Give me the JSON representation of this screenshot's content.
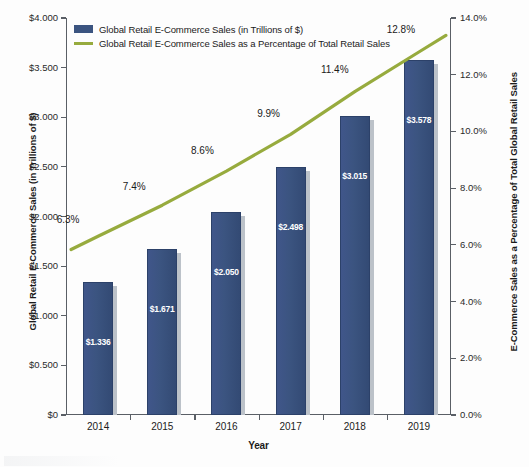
{
  "chart_data": {
    "type": "bar",
    "title": "",
    "subtitle": "",
    "xlabel": "Year",
    "ylabel": "Global Retail E-Commerce Sales (in Trillions of $)",
    "y2label": "E-Commerce Sales as a Percentage of Total Global Retail Sales",
    "categories": [
      "2014",
      "2015",
      "2016",
      "2017",
      "2018",
      "2019"
    ],
    "ylim": [
      0,
      4.0
    ],
    "y2lim": [
      0,
      14.0
    ],
    "grid": false,
    "legend_position": "top-left",
    "series": [
      {
        "name": "Global Retail E-Commerce Sales (in Trillions of $)",
        "type": "bar",
        "axis": "left",
        "color": "#3B5480",
        "values": [
          1.336,
          1.671,
          2.05,
          2.498,
          3.015,
          3.578
        ],
        "labels": [
          "$1.336",
          "$1.671",
          "$2.050",
          "$2.498",
          "$3.015",
          "$3.578"
        ]
      },
      {
        "name": "Global Retail E-Commerce Sales as a Percentage of Total Retail Sales",
        "type": "line",
        "axis": "right",
        "color": "#97AB3E",
        "values": [
          6.3,
          7.4,
          8.6,
          9.9,
          11.4,
          12.8
        ],
        "labels": [
          "6.3%",
          "7.4%",
          "8.6%",
          "9.9%",
          "11.4%",
          "12.8%"
        ]
      }
    ],
    "left_ticks": [
      "$0",
      "$0.500",
      "$1.000",
      "$1.500",
      "$2.000",
      "$2.500",
      "$3.000",
      "$3.500",
      "$4.000"
    ],
    "left_tick_values": [
      0,
      0.5,
      1.0,
      1.5,
      2.0,
      2.5,
      3.0,
      3.5,
      4.0
    ],
    "right_ticks": [
      "0.0%",
      "2.0%",
      "4.0%",
      "6.0%",
      "8.0%",
      "10.0%",
      "12.0%",
      "14.0%"
    ],
    "right_tick_values": [
      0,
      2,
      4,
      6,
      8,
      10,
      12,
      14
    ]
  },
  "axes": {
    "left_title": "Global Retail E-Commerce Sales (in Trillions of $)",
    "right_title": "E-Commerce Sales as a Percentage of Total Global Retail Sales",
    "x_title": "Year"
  },
  "legend": {
    "items": [
      {
        "label": "Global Retail E-Commerce Sales (in Trillions of $)",
        "color": "#3B5480",
        "marker": "bar-swatch"
      },
      {
        "label": "Global Retail E-Commerce Sales as a Percentage of Total Retail Sales",
        "color": "#97AB3E",
        "marker": "line-swatch"
      }
    ]
  },
  "colors": {
    "bar": "#3B5480",
    "line": "#97AB3E",
    "axis": "#5A5F66",
    "text": "#1B1B1B",
    "bar_shadow": "#BCC2C9"
  }
}
